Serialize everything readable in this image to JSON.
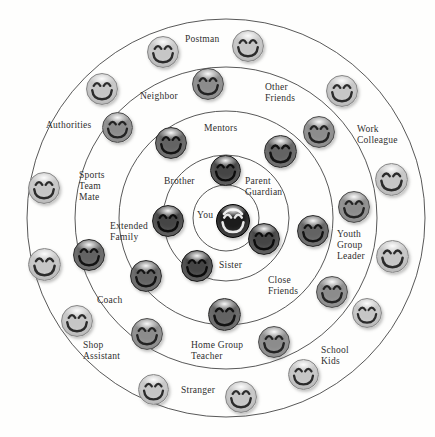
{
  "diagram": {
    "background": "#fefefd",
    "circle_stroke": "#3b3b3b",
    "center": {
      "x": 226,
      "y": 218
    },
    "ring_radii": [
      33,
      63,
      107,
      151,
      199
    ],
    "tones": {
      "black": {
        "base": "#1b1b1b",
        "edge": "#000000",
        "feature": "#e8e8e8"
      },
      "darkest": {
        "base": "#454545",
        "edge": "#1d1d1d",
        "feature": "#0c0c0c"
      },
      "dark": {
        "base": "#636363",
        "edge": "#2c2c2c",
        "feature": "#131313"
      },
      "medium": {
        "base": "#8c8c8c",
        "edge": "#4e4e4e",
        "feature": "#232323"
      },
      "light": {
        "base": "#c6c6c6",
        "edge": "#878787",
        "feature": "#2b2b2b"
      }
    },
    "labels": [
      {
        "id": "you",
        "text": "You",
        "x": 197,
        "y": 210
      },
      {
        "id": "brother",
        "text": "Brother",
        "x": 164,
        "y": 176
      },
      {
        "id": "parent-guardian",
        "text": "Parent\nGuardian",
        "x": 245,
        "y": 176
      },
      {
        "id": "sister",
        "text": "Sister",
        "x": 219,
        "y": 260
      },
      {
        "id": "mentors",
        "text": "Mentors",
        "x": 204,
        "y": 123
      },
      {
        "id": "extended-family",
        "text": "Extended\nFamily",
        "x": 110,
        "y": 221
      },
      {
        "id": "close-friends",
        "text": "Close\nFriends",
        "x": 268,
        "y": 275
      },
      {
        "id": "neighbor",
        "text": "Neighbor",
        "x": 140,
        "y": 91
      },
      {
        "id": "other-friends",
        "text": "Other\nFriends",
        "x": 265,
        "y": 82
      },
      {
        "id": "sports-team-mate",
        "text": "Sports\nTeam\nMate",
        "x": 79,
        "y": 170
      },
      {
        "id": "youth-group-leader",
        "text": "Youth\nGroup\nLeader",
        "x": 337,
        "y": 229
      },
      {
        "id": "coach",
        "text": "Coach",
        "x": 97,
        "y": 295
      },
      {
        "id": "home-group-teacher",
        "text": "Home Group\nTeacher",
        "x": 191,
        "y": 340
      },
      {
        "id": "postman",
        "text": "Postman",
        "x": 185,
        "y": 34
      },
      {
        "id": "authorities",
        "text": "Authorities",
        "x": 46,
        "y": 120
      },
      {
        "id": "work-colleague",
        "text": "Work\nColleague",
        "x": 357,
        "y": 124
      },
      {
        "id": "shop-assistant",
        "text": "Shop\nAssistant",
        "x": 83,
        "y": 340
      },
      {
        "id": "school-kids",
        "text": "School\nKids",
        "x": 321,
        "y": 345
      },
      {
        "id": "stranger",
        "text": "Stranger",
        "x": 181,
        "y": 385
      }
    ],
    "faces": [
      {
        "x": 232,
        "y": 220,
        "d": 32,
        "tone": "black"
      },
      {
        "x": 224,
        "y": 169,
        "d": 29,
        "tone": "darkest"
      },
      {
        "x": 167,
        "y": 220,
        "d": 30,
        "tone": "darkest"
      },
      {
        "x": 263,
        "y": 238,
        "d": 30,
        "tone": "darkest"
      },
      {
        "x": 196,
        "y": 265,
        "d": 30,
        "tone": "darkest"
      },
      {
        "x": 170,
        "y": 142,
        "d": 30,
        "tone": "dark"
      },
      {
        "x": 279,
        "y": 150,
        "d": 31,
        "tone": "dark"
      },
      {
        "x": 312,
        "y": 230,
        "d": 30,
        "tone": "dark"
      },
      {
        "x": 223,
        "y": 313,
        "d": 31,
        "tone": "dark"
      },
      {
        "x": 145,
        "y": 275,
        "d": 30,
        "tone": "dark"
      },
      {
        "x": 88,
        "y": 254,
        "d": 30,
        "tone": "dark"
      },
      {
        "x": 207,
        "y": 83,
        "d": 30,
        "tone": "medium"
      },
      {
        "x": 116,
        "y": 126,
        "d": 29,
        "tone": "medium"
      },
      {
        "x": 318,
        "y": 131,
        "d": 30,
        "tone": "medium"
      },
      {
        "x": 353,
        "y": 206,
        "d": 30,
        "tone": "medium"
      },
      {
        "x": 331,
        "y": 291,
        "d": 30,
        "tone": "medium"
      },
      {
        "x": 146,
        "y": 333,
        "d": 30,
        "tone": "medium"
      },
      {
        "x": 273,
        "y": 341,
        "d": 30,
        "tone": "medium"
      },
      {
        "x": 162,
        "y": 51,
        "d": 30,
        "tone": "light"
      },
      {
        "x": 247,
        "y": 45,
        "d": 30,
        "tone": "light"
      },
      {
        "x": 101,
        "y": 88,
        "d": 30,
        "tone": "light"
      },
      {
        "x": 341,
        "y": 90,
        "d": 30,
        "tone": "light"
      },
      {
        "x": 43,
        "y": 187,
        "d": 30,
        "tone": "light"
      },
      {
        "x": 390,
        "y": 178,
        "d": 31,
        "tone": "light"
      },
      {
        "x": 43,
        "y": 263,
        "d": 31,
        "tone": "light"
      },
      {
        "x": 391,
        "y": 255,
        "d": 31,
        "tone": "light"
      },
      {
        "x": 76,
        "y": 320,
        "d": 30,
        "tone": "light"
      },
      {
        "x": 366,
        "y": 312,
        "d": 28,
        "tone": "light"
      },
      {
        "x": 152,
        "y": 388,
        "d": 29,
        "tone": "light"
      },
      {
        "x": 240,
        "y": 396,
        "d": 30,
        "tone": "light"
      },
      {
        "x": 302,
        "y": 373,
        "d": 29,
        "tone": "light"
      }
    ]
  }
}
